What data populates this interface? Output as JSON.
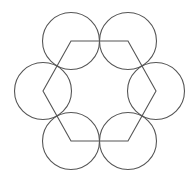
{
  "diagram": {
    "stroke_color": "#555555",
    "stroke_width": 1.1,
    "background": "#ffffff",
    "hexagon": {
      "center": [
        99.5,
        91
      ],
      "vertices": [
        [
          71,
          41
        ],
        [
          128,
          41
        ],
        [
          156,
          91
        ],
        [
          128,
          141
        ],
        [
          71,
          141
        ],
        [
          43,
          91
        ]
      ]
    },
    "circles": [
      {
        "cx": 71,
        "cy": 41,
        "r": 28.5
      },
      {
        "cx": 128,
        "cy": 41,
        "r": 28.5
      },
      {
        "cx": 156,
        "cy": 91,
        "r": 28.5
      },
      {
        "cx": 128,
        "cy": 141,
        "r": 28.5
      },
      {
        "cx": 71,
        "cy": 141,
        "r": 28.5
      },
      {
        "cx": 43,
        "cy": 91,
        "r": 28.5
      }
    ]
  }
}
